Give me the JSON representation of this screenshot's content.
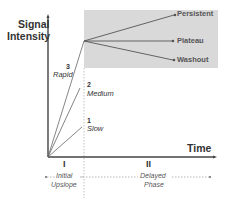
{
  "diagram": {
    "y_axis_label_line1": "Signal",
    "y_axis_label_line2": "Intensity",
    "x_axis_label": "Time",
    "phases": [
      {
        "numeral": "I",
        "label_line1": "Initial",
        "label_line2": "Upslope"
      },
      {
        "numeral": "II",
        "label_line1": "Delayed",
        "label_line2": "Phase"
      }
    ],
    "upslope_curves": [
      {
        "number": "1",
        "label": "Slow"
      },
      {
        "number": "2",
        "label": "Medium"
      },
      {
        "number": "3",
        "label": "Rapid"
      }
    ],
    "delayed_curves": [
      {
        "label": "Persistent"
      },
      {
        "label": "Plateau"
      },
      {
        "label": "Washout"
      }
    ],
    "colors": {
      "shaded_region": "#d9d9d9",
      "lines": "#555555",
      "text": "#333333"
    }
  }
}
